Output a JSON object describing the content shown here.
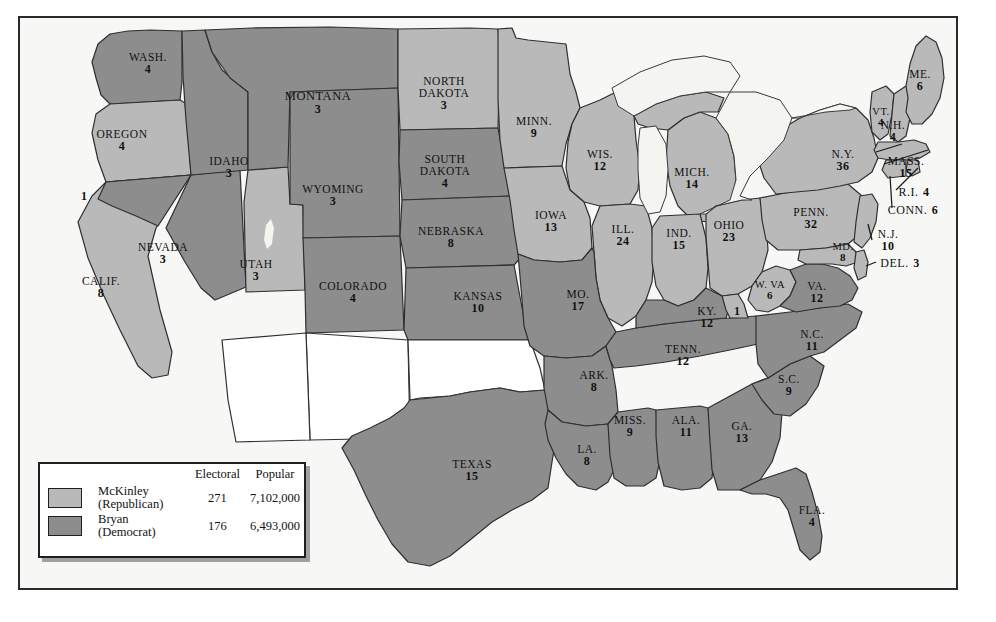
{
  "map": {
    "title": "Election of 1896",
    "colors": {
      "mckinley_fill": "#b9b9b9",
      "bryan_fill": "#8d8d8d",
      "territory_fill": "#ffffff",
      "water_fill": "#f2f2ee",
      "border_stroke": "#2f2f2f",
      "page_background": "#f7f7f5"
    }
  },
  "legend": {
    "headers": [
      "Electoral",
      "Popular"
    ],
    "rows": [
      {
        "candidate_line1": "McKinley",
        "candidate_line2": "(Republican)",
        "electoral": "271",
        "popular": "7,102,000",
        "swatch": "mckinley-swatch"
      },
      {
        "candidate_line1": "Bryan",
        "candidate_line2": "(Democrat)",
        "electoral": "176",
        "popular": "6,493,000",
        "swatch": "bryan-swatch"
      }
    ]
  },
  "states": [
    {
      "id": "wash",
      "name": "WASH.",
      "ev": "4",
      "party": "bryan",
      "x": 148,
      "y": 63,
      "style": ""
    },
    {
      "id": "oregon",
      "name": "OREGON",
      "ev": "4",
      "party": "mckinley",
      "x": 122,
      "y": 140,
      "style": ""
    },
    {
      "id": "calif",
      "name": "CALIF.",
      "ev": "8",
      "party": "mckinley",
      "x": 101,
      "y": 287,
      "style": ""
    },
    {
      "id": "nevada",
      "name": "NEVADA",
      "ev": "3",
      "party": "bryan",
      "x": 163,
      "y": 253,
      "style": ""
    },
    {
      "id": "idaho",
      "name": "IDAHO",
      "ev": "3",
      "party": "bryan",
      "x": 229,
      "y": 167,
      "style": ""
    },
    {
      "id": "utah",
      "name": "UTAH",
      "ev": "3",
      "party": "mckinley",
      "x": 256,
      "y": 270,
      "style": ""
    },
    {
      "id": "montana",
      "name": "MONTANA",
      "ev": "3",
      "party": "bryan",
      "x": 318,
      "y": 103,
      "style": "big"
    },
    {
      "id": "wyoming",
      "name": "WYOMING",
      "ev": "3",
      "party": "bryan",
      "x": 333,
      "y": 195,
      "style": ""
    },
    {
      "id": "colorado",
      "name": "COLORADO",
      "ev": "4",
      "party": "bryan",
      "x": 353,
      "y": 292,
      "style": ""
    },
    {
      "id": "ndakota",
      "name": "NORTH\nDAKOTA",
      "ev": "3",
      "party": "mckinley",
      "x": 444,
      "y": 94,
      "style": "two-line"
    },
    {
      "id": "sdakota",
      "name": "SOUTH\nDAKOTA",
      "ev": "4",
      "party": "bryan",
      "x": 445,
      "y": 172,
      "style": "two-line"
    },
    {
      "id": "nebraska",
      "name": "NEBRASKA",
      "ev": "8",
      "party": "bryan",
      "x": 451,
      "y": 237,
      "style": ""
    },
    {
      "id": "kansas",
      "name": "KANSAS",
      "ev": "10",
      "party": "bryan",
      "x": 478,
      "y": 302,
      "style": ""
    },
    {
      "id": "texas",
      "name": "TEXAS",
      "ev": "15",
      "party": "bryan",
      "x": 472,
      "y": 470,
      "style": ""
    },
    {
      "id": "minn",
      "name": "MINN.",
      "ev": "9",
      "party": "mckinley",
      "x": 534,
      "y": 127,
      "style": ""
    },
    {
      "id": "iowa",
      "name": "IOWA",
      "ev": "13",
      "party": "mckinley",
      "x": 551,
      "y": 221,
      "style": ""
    },
    {
      "id": "missouri",
      "name": "MO.",
      "ev": "17",
      "party": "bryan",
      "x": 578,
      "y": 300,
      "style": ""
    },
    {
      "id": "arkansas",
      "name": "ARK.",
      "ev": "8",
      "party": "bryan",
      "x": 594,
      "y": 381,
      "style": ""
    },
    {
      "id": "louisiana",
      "name": "LA.",
      "ev": "8",
      "party": "bryan",
      "x": 587,
      "y": 455,
      "style": ""
    },
    {
      "id": "wisconsin",
      "name": "WIS.",
      "ev": "12",
      "party": "mckinley",
      "x": 600,
      "y": 160,
      "style": ""
    },
    {
      "id": "illinois",
      "name": "ILL.",
      "ev": "24",
      "party": "mckinley",
      "x": 623,
      "y": 235,
      "style": ""
    },
    {
      "id": "mich",
      "name": "MICH.",
      "ev": "14",
      "party": "mckinley",
      "x": 692,
      "y": 178,
      "style": ""
    },
    {
      "id": "indiana",
      "name": "IND.",
      "ev": "15",
      "party": "mckinley",
      "x": 679,
      "y": 239,
      "style": ""
    },
    {
      "id": "ohio",
      "name": "OHIO",
      "ev": "23",
      "party": "mckinley",
      "x": 729,
      "y": 231,
      "style": ""
    },
    {
      "id": "kentucky",
      "name": "KY.",
      "ev": "12",
      "party": "bryan",
      "x": 707,
      "y": 317,
      "style": ""
    },
    {
      "id": "mississippi",
      "name": "MISS.",
      "ev": "9",
      "party": "bryan",
      "x": 630,
      "y": 426,
      "style": ""
    },
    {
      "id": "alabama",
      "name": "ALA.",
      "ev": "11",
      "party": "bryan",
      "x": 686,
      "y": 426,
      "style": ""
    },
    {
      "id": "tennessee",
      "name": "TENN.",
      "ev": "12",
      "party": "bryan",
      "x": 683,
      "y": 355,
      "style": ""
    },
    {
      "id": "georgia",
      "name": "GA.",
      "ev": "13",
      "party": "bryan",
      "x": 742,
      "y": 432,
      "style": ""
    },
    {
      "id": "scarolina",
      "name": "S.C.",
      "ev": "9",
      "party": "bryan",
      "x": 789,
      "y": 385,
      "style": ""
    },
    {
      "id": "ncarolina",
      "name": "N.C.",
      "ev": "11",
      "party": "bryan",
      "x": 812,
      "y": 340,
      "style": ""
    },
    {
      "id": "florida",
      "name": "FLA.",
      "ev": "4",
      "party": "bryan",
      "x": 812,
      "y": 516,
      "style": ""
    },
    {
      "id": "wvirginia",
      "name": "W. VA",
      "ev": "6",
      "party": "mckinley",
      "x": 770,
      "y": 290,
      "style": "small"
    },
    {
      "id": "virginia",
      "name": "VA.",
      "ev": "12",
      "party": "bryan",
      "x": 817,
      "y": 292,
      "style": ""
    },
    {
      "id": "penn",
      "name": "PENN.",
      "ev": "32",
      "party": "mckinley",
      "x": 811,
      "y": 218,
      "style": ""
    },
    {
      "id": "newyork",
      "name": "N.Y.",
      "ev": "36",
      "party": "mckinley",
      "x": 843,
      "y": 160,
      "style": ""
    },
    {
      "id": "vermont",
      "name": "VT.",
      "ev": "4",
      "party": "mckinley",
      "x": 881,
      "y": 117,
      "style": "small"
    },
    {
      "id": "maine",
      "name": "ME.",
      "ev": "6",
      "party": "mckinley",
      "x": 920,
      "y": 80,
      "style": ""
    },
    {
      "id": "maryland",
      "name": "MD.",
      "ev": "8",
      "party": "mckinley",
      "x": 843,
      "y": 252,
      "style": "small"
    }
  ],
  "callout_states": [
    {
      "id": "newhampshire",
      "name": "N.H.",
      "ev": "4",
      "x": 893,
      "y": 131,
      "two_line": true
    },
    {
      "id": "mass",
      "name": "MASS.",
      "ev": "15",
      "x": 906,
      "y": 167,
      "two_line": true
    },
    {
      "id": "rhodeisland",
      "name": "R.I.",
      "ev": "4",
      "x": 914,
      "y": 191,
      "two_line": false
    },
    {
      "id": "connecticut",
      "name": "CONN.",
      "ev": "6",
      "x": 913,
      "y": 209,
      "two_line": false
    },
    {
      "id": "newjersey",
      "name": "N.J.",
      "ev": "10",
      "x": 888,
      "y": 240,
      "two_line": true
    },
    {
      "id": "delaware",
      "name": "DEL.",
      "ev": "3",
      "x": 900,
      "y": 262,
      "two_line": false
    }
  ],
  "split_fragments": [
    {
      "id": "calif-bryan-elector",
      "label": "1",
      "x": 84,
      "y": 196,
      "party": "bryan",
      "note": "California split elector"
    },
    {
      "id": "kentucky-mckinley-elector",
      "label": "1",
      "x": 737,
      "y": 311,
      "party": "mckinley",
      "note": "Kentucky split elector"
    }
  ],
  "territories": [
    {
      "id": "new-mexico-territory",
      "label": ""
    },
    {
      "id": "arizona-territory",
      "label": ""
    },
    {
      "id": "oklahoma-territory",
      "label": ""
    },
    {
      "id": "indian-territory",
      "label": ""
    }
  ]
}
